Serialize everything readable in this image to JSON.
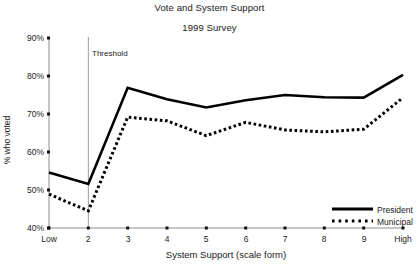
{
  "chart_data": {
    "type": "line",
    "title": "Vote and System Support",
    "subtitle": "1999 Survey",
    "xlabel": "System Support (scale form)",
    "ylabel": "% who voted",
    "grid": false,
    "legend_position": "bottom-right",
    "x": [
      1,
      2,
      3,
      4,
      5,
      6,
      7,
      8,
      9,
      10
    ],
    "categories": [
      "Low",
      "2",
      "3",
      "4",
      "5",
      "6",
      "7",
      "8",
      "9",
      "High"
    ],
    "xtick_labels": [
      "Low",
      "2",
      "3",
      "4",
      "5",
      "6",
      "7",
      "8",
      "9",
      "High"
    ],
    "ytick_labels": [
      "40%",
      "50%",
      "60%",
      "70%",
      "80%",
      "90%"
    ],
    "ytick_values": [
      40,
      50,
      60,
      70,
      80,
      90
    ],
    "ylim": [
      40,
      90
    ],
    "xlim": [
      1,
      10
    ],
    "series": [
      {
        "name": "President",
        "style": "solid",
        "color": "#000000",
        "values": [
          54.6,
          51.6,
          76.9,
          73.9,
          71.7,
          73.6,
          75.0,
          74.4,
          74.3,
          80.3
        ]
      },
      {
        "name": "Municipal",
        "style": "dotted",
        "color": "#000000",
        "values": [
          48.9,
          44.5,
          69.2,
          68.2,
          64.3,
          67.8,
          65.8,
          65.3,
          66.0,
          74.3
        ]
      }
    ],
    "annotations": [
      {
        "name": "threshold",
        "label": "Threshold",
        "x": 2,
        "type": "vertical-line",
        "color": "#9a9a9a"
      }
    ]
  },
  "legend": {
    "items": [
      {
        "label": "President",
        "style": "solid"
      },
      {
        "label": "Municipal",
        "style": "dotted"
      }
    ]
  }
}
